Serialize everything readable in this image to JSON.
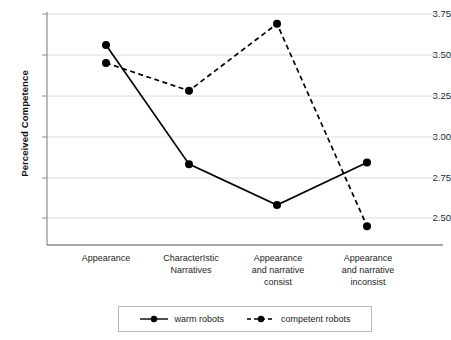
{
  "chart_data": {
    "type": "line",
    "title": "",
    "xlabel": "",
    "ylabel": "Perceived Competence",
    "ylim": [
      2.4375,
      3.78
    ],
    "yticks": [
      3.75,
      3.5,
      3.25,
      3.0,
      2.75,
      2.5
    ],
    "ytick_labels": [
      "3.75",
      "3.50",
      "3.25",
      "3.00",
      "2.75",
      "2.50"
    ],
    "grid": true,
    "grid_axis": "y",
    "legend_position": "bottom",
    "categories": [
      "Appearance",
      "CharacterIstic Narratives",
      "Appearance and narrative consist",
      "Appearance and narrative inconsist"
    ],
    "category_lines": [
      [
        "Appearance"
      ],
      [
        "CharacterIstic",
        "Narratives"
      ],
      [
        "Appearance",
        "and narrative",
        "consist"
      ],
      [
        "Appearance",
        "and narrative",
        "inconsist"
      ]
    ],
    "series": [
      {
        "name": "warm robots",
        "style": "solid",
        "color": "#000000",
        "marker": "circle",
        "values": [
          3.56,
          2.83,
          2.58,
          2.84
        ]
      },
      {
        "name": "competent robots",
        "style": "dashed",
        "color": "#000000",
        "marker": "circle",
        "values": [
          3.45,
          3.28,
          3.69,
          2.45
        ]
      }
    ]
  },
  "legend": {
    "items": [
      {
        "label": "warm robots",
        "style": "solid"
      },
      {
        "label": "competent robots",
        "style": "dashed"
      }
    ]
  },
  "colors": {
    "line": "#000000",
    "grid": "#d9d9d9",
    "axis": "#808080",
    "text": "#1d1d1d",
    "background": "#ffffff",
    "legend_border": "#b9b9b9"
  }
}
